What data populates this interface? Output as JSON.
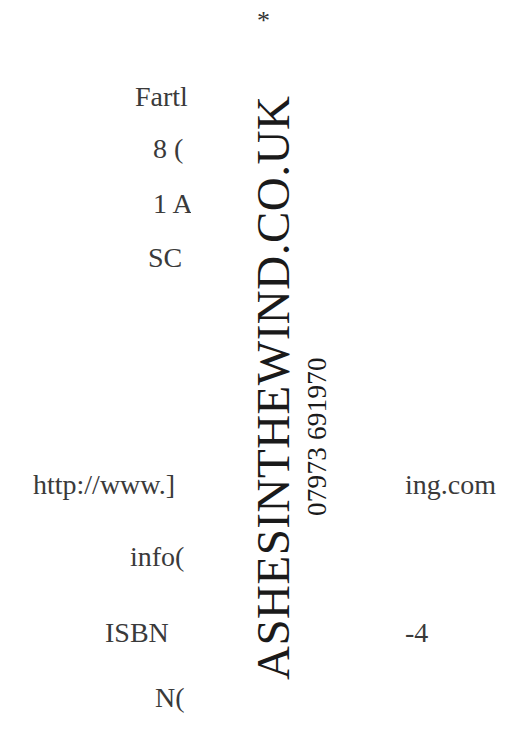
{
  "document": {
    "top_mark": "*",
    "imprint_left": {
      "publisher_partial": "Fartl",
      "address_line1_partial": "8 (",
      "address_line2_partial": "1 A",
      "postcode_partial": "SC",
      "url_left_partial": "http://www.]",
      "email_partial": "info(",
      "isbn_label": "ISBN",
      "notice_partial": "N("
    },
    "imprint_right": {
      "url_right_partial": "ing.com",
      "isbn_suffix": "-4"
    },
    "overlay_stamp": {
      "website": "ASHESINTHEWIND.CO.UK",
      "phone": "07973 691970"
    }
  }
}
